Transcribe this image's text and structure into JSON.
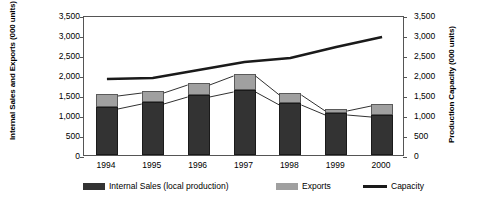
{
  "chart_data": {
    "type": "bar",
    "title": "",
    "subtitle": "",
    "categories": [
      "1994",
      "1995",
      "1996",
      "1997",
      "1998",
      "1999",
      "2000"
    ],
    "xlabel": "",
    "ylabel": "Internal Sales and Exports (000 units)",
    "y2label": "Production Capacity (000 units)",
    "ylim": [
      0,
      3500
    ],
    "y2lim": [
      0,
      3500
    ],
    "ytick_labels": [
      "3,500",
      "3,000",
      "2,500",
      "2,000",
      "1,500",
      "1,000",
      "500",
      "0"
    ],
    "ytick_values": [
      3500,
      3000,
      2500,
      2000,
      1500,
      1000,
      500,
      0
    ],
    "y2tick_labels": [
      "3,500",
      "3,000",
      "2,500",
      "2,000",
      "1,500",
      "1,000",
      "500",
      "0"
    ],
    "y2tick_values": [
      3500,
      3000,
      2500,
      2000,
      1500,
      1000,
      500,
      0
    ],
    "grid": false,
    "legend_position": "bottom",
    "stacked": true,
    "series": [
      {
        "name": "Internal Sales (local production)",
        "kind": "bar-stack",
        "axis": "left",
        "color": "#333333",
        "values": [
          1200,
          1325,
          1500,
          1625,
          1300,
          1050,
          1000
        ]
      },
      {
        "name": "Exports",
        "kind": "bar-stack",
        "axis": "left",
        "color": "#a0a0a0",
        "values": [
          325,
          275,
          300,
          400,
          250,
          100,
          275
        ]
      },
      {
        "name": "Capacity",
        "kind": "line",
        "axis": "right",
        "color": "#1a1a1a",
        "values": [
          1950,
          1975,
          2175,
          2375,
          2475,
          2750,
          3000
        ]
      }
    ],
    "totals": [
      1525,
      1600,
      1800,
      2025,
      1550,
      1150,
      1275
    ]
  },
  "legend": {
    "items": [
      {
        "label": "Internal Sales (local production)",
        "swatch": "internal-sales-swatch"
      },
      {
        "label": "Exports",
        "swatch": "exports-swatch"
      },
      {
        "label": "Capacity",
        "swatch": "capacity-line-swatch"
      }
    ]
  }
}
